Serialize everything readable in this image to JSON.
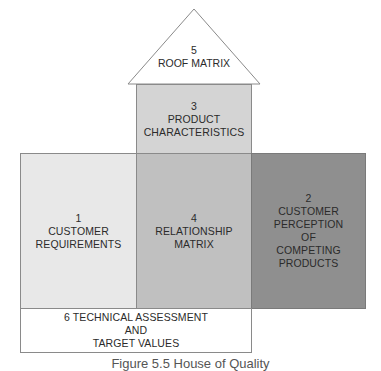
{
  "diagram": {
    "type": "house-of-quality",
    "sections": {
      "roof": {
        "number": "5",
        "label": "ROOF MATRIX",
        "fill": "#ffffff"
      },
      "product": {
        "number": "3",
        "line1": "PRODUCT",
        "line2": "CHARACTERISTICS",
        "fill": "#d4d4d4"
      },
      "customer_req": {
        "number": "1",
        "line1": "CUSTOMER",
        "line2": "REQUIREMENTS",
        "fill": "#e8e8e8"
      },
      "relationship": {
        "number": "4",
        "line1": "RELATIONSHIP",
        "line2": "MATRIX",
        "fill": "#c0c0c0"
      },
      "perception": {
        "number": "2",
        "line1": "CUSTOMER",
        "line2": "PERCEPTION",
        "line3": "OF",
        "line4": "COMPETING",
        "line5": "PRODUCTS",
        "fill": "#8f8f8f"
      },
      "technical": {
        "line1": "6 TECHNICAL ASSESSMENT",
        "line2": "AND",
        "line3": "TARGET VALUES",
        "fill": "#ffffff"
      }
    },
    "caption": "Figure 5.5  House of Quality"
  }
}
